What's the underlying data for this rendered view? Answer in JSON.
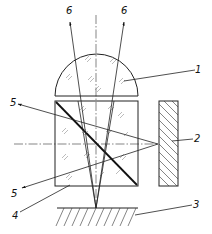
{
  "diagram": {
    "type": "optical-schematic",
    "labels": {
      "ray_out_left": "6",
      "ray_out_right": "6",
      "lens": "1",
      "plate": "2",
      "surface": "3",
      "cube": "4",
      "ray_in_top": "5",
      "ray_in_bottom": "5"
    },
    "components": [
      {
        "id": "1",
        "name": "hemispherical lens"
      },
      {
        "id": "2",
        "name": "hatched reflector plate"
      },
      {
        "id": "3",
        "name": "hatched base surface"
      },
      {
        "id": "4",
        "name": "beam-splitter cube with diagonal"
      },
      {
        "id": "5",
        "name": "incoming/outgoing side rays"
      },
      {
        "id": "6",
        "name": "upward output rays"
      }
    ],
    "colors": {
      "line": "#222222",
      "background": "#ffffff"
    }
  }
}
